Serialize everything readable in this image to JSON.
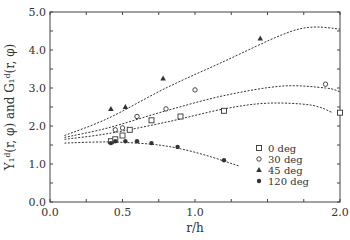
{
  "chart_data": {
    "type": "scatter",
    "title": "",
    "xlabel": "r/h",
    "ylabel": "Y₁ᵈ(r, φ) and G₁ᵈ(r, φ)",
    "xlim": [
      0.0,
      2.0
    ],
    "ylim": [
      0.0,
      5.0
    ],
    "x_ticks": [
      "0.0",
      "0.5",
      "1.0",
      "2.0"
    ],
    "x_tick_values": [
      0.0,
      0.5,
      1.0,
      2.0
    ],
    "y_ticks": [
      "0.0",
      "1.0",
      "2.0",
      "3.0",
      "4.0",
      "5.0"
    ],
    "y_tick_values": [
      0,
      1,
      2,
      3,
      4,
      5
    ],
    "grid": false,
    "legend_position": "inside lower right",
    "series": [
      {
        "name": "0 deg",
        "marker": "square-open",
        "points": [
          [
            0.42,
            1.6
          ],
          [
            0.45,
            1.65
          ],
          [
            0.5,
            1.75
          ],
          [
            0.55,
            1.9
          ],
          [
            0.7,
            2.15
          ],
          [
            0.9,
            2.25
          ],
          [
            1.2,
            2.4
          ],
          [
            2.0,
            2.35
          ]
        ],
        "fit": [
          [
            0.1,
            1.65
          ],
          [
            0.4,
            1.8
          ],
          [
            0.8,
            2.1
          ],
          [
            1.2,
            2.45
          ],
          [
            1.5,
            2.6
          ],
          [
            1.8,
            2.55
          ],
          [
            1.95,
            2.35
          ]
        ]
      },
      {
        "name": "30 deg",
        "marker": "circle-open",
        "points": [
          [
            0.45,
            1.9
          ],
          [
            0.5,
            1.95
          ],
          [
            0.6,
            2.25
          ],
          [
            0.8,
            2.45
          ],
          [
            1.0,
            2.95
          ],
          [
            1.9,
            3.1
          ]
        ],
        "fit": [
          [
            0.1,
            1.7
          ],
          [
            0.4,
            1.95
          ],
          [
            0.8,
            2.4
          ],
          [
            1.2,
            2.8
          ],
          [
            1.6,
            3.05
          ],
          [
            1.9,
            3.0
          ],
          [
            2.0,
            2.9
          ]
        ]
      },
      {
        "name": "45 deg",
        "marker": "triangle-filled",
        "points": [
          [
            0.42,
            2.45
          ],
          [
            0.52,
            2.5
          ],
          [
            0.78,
            3.25
          ],
          [
            1.45,
            4.3
          ]
        ],
        "fit": [
          [
            0.1,
            1.75
          ],
          [
            0.4,
            2.2
          ],
          [
            0.8,
            3.0
          ],
          [
            1.2,
            3.7
          ],
          [
            1.6,
            4.4
          ],
          [
            1.8,
            4.6
          ],
          [
            2.0,
            4.55
          ]
        ]
      },
      {
        "name": "120 deg",
        "marker": "circle-filled",
        "points": [
          [
            0.42,
            1.55
          ],
          [
            0.45,
            1.6
          ],
          [
            0.52,
            1.6
          ],
          [
            0.6,
            1.6
          ],
          [
            0.7,
            1.55
          ],
          [
            0.88,
            1.45
          ],
          [
            1.2,
            1.1
          ]
        ],
        "fit": [
          [
            0.1,
            1.55
          ],
          [
            0.4,
            1.58
          ],
          [
            0.7,
            1.52
          ],
          [
            0.9,
            1.4
          ],
          [
            1.1,
            1.2
          ],
          [
            1.3,
            0.95
          ]
        ]
      }
    ]
  }
}
